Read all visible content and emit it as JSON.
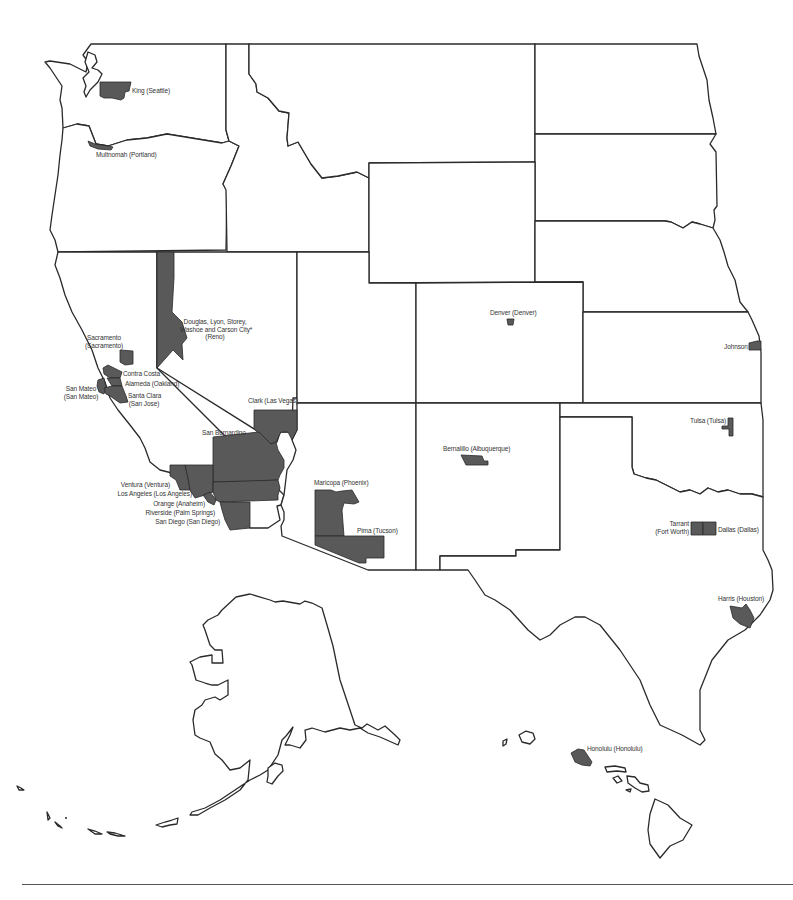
{
  "map": {
    "type": "reference map",
    "region": "Western and South-Central United States with Alaska and Hawaii insets",
    "highlight_color": "#595959",
    "border_color": "#2a2a2a",
    "background_color": "#ffffff"
  },
  "counties": [
    {
      "id": "king",
      "label": "King (Seattle)"
    },
    {
      "id": "multnomah",
      "label": "Multnomah (Portland)"
    },
    {
      "id": "reno",
      "label_lines": [
        "Douglas, Lyon, Storey,",
        "Washoe and Carson City*",
        "(Reno)"
      ]
    },
    {
      "id": "sacramento",
      "label_lines": [
        "Sacramento",
        "(Sacramento)"
      ]
    },
    {
      "id": "contra-costa",
      "label": "Contra Costa"
    },
    {
      "id": "alameda",
      "label": "Alameda (Oakland)"
    },
    {
      "id": "san-mateo",
      "label_lines": [
        "San Mateo",
        "(San Mateo)"
      ]
    },
    {
      "id": "santa-clara",
      "label_lines": [
        "Santa Clara",
        "(San Jose)"
      ]
    },
    {
      "id": "clark",
      "label": "Clark (Las Vegas)"
    },
    {
      "id": "san-bernardino",
      "label": "San Bernardino"
    },
    {
      "id": "ventura",
      "label": "Ventura (Ventura)"
    },
    {
      "id": "los-angeles",
      "label": "Los Angeles (Los Angeles)"
    },
    {
      "id": "orange",
      "label": "Orange (Anaheim)"
    },
    {
      "id": "riverside",
      "label": "Riverside (Palm Springs)"
    },
    {
      "id": "san-diego",
      "label": "San Diego (San Diego)"
    },
    {
      "id": "maricopa",
      "label": "Maricopa (Phoenix)"
    },
    {
      "id": "pima",
      "label": "Pima (Tucson)"
    },
    {
      "id": "denver",
      "label": "Denver (Denver)"
    },
    {
      "id": "bernalillo",
      "label": "Bernalillo (Albuquerque)"
    },
    {
      "id": "johnson",
      "label": "Johnson"
    },
    {
      "id": "tulsa",
      "label": "Tulsa (Tulsa)"
    },
    {
      "id": "tarrant",
      "label_lines": [
        "Tarrant",
        "(Fort Worth)"
      ]
    },
    {
      "id": "dallas",
      "label": "Dallas (Dallas)"
    },
    {
      "id": "harris",
      "label": "Harris (Houston)"
    },
    {
      "id": "honolulu",
      "label": "Honolulu (Honolulu)"
    }
  ]
}
